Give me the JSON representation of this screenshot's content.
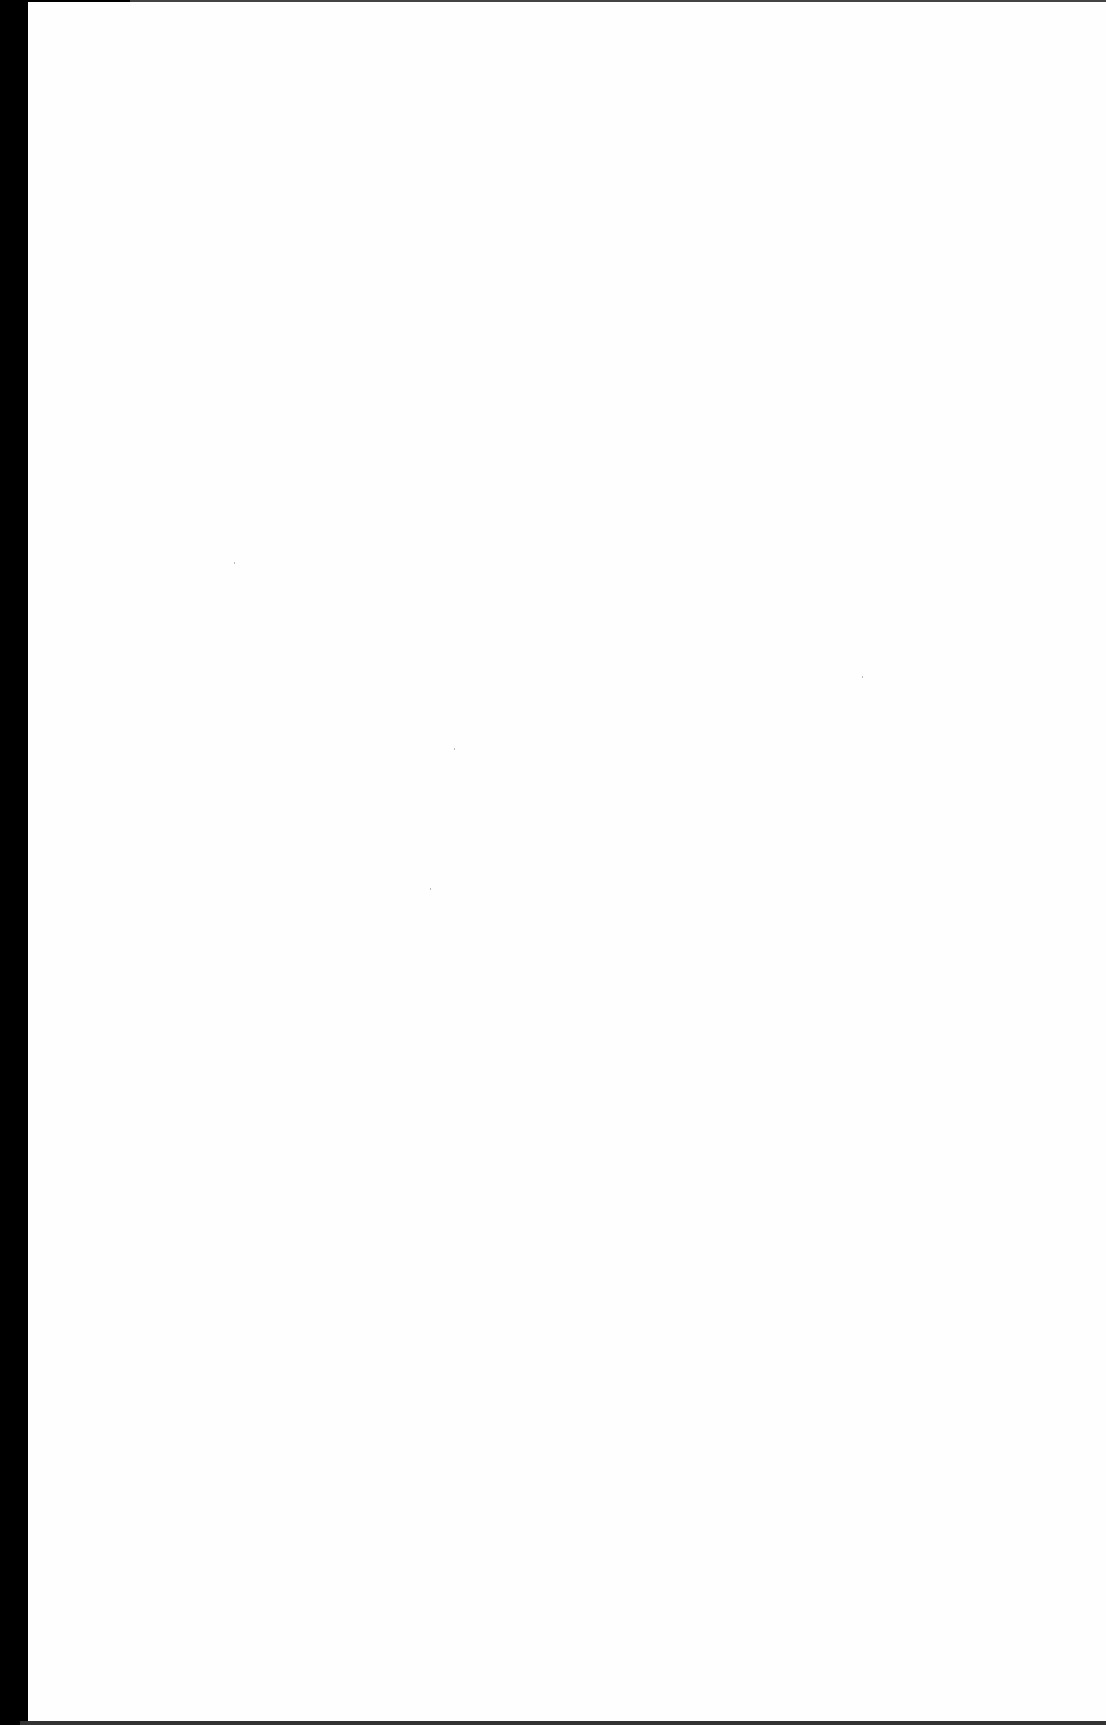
{
  "page": {
    "type": "blank-scanned-page",
    "content": "",
    "colors": {
      "paper": "#fefefe",
      "edge": "#000000"
    }
  }
}
